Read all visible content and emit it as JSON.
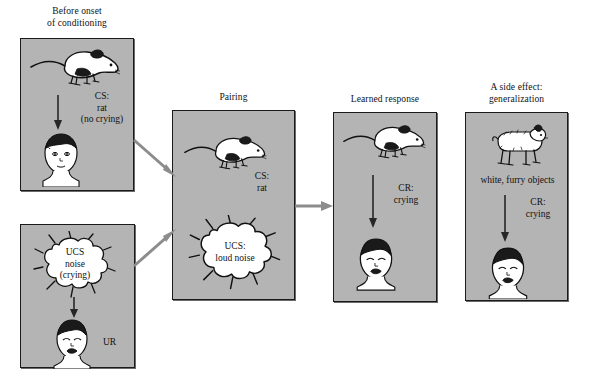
{
  "figure": {
    "background_color": "#ffffff",
    "panel_fill": "#b4b4b4",
    "panel_border": "#1a1a1a",
    "arrow_color_between_panels": "#8c8c8c",
    "arrow_color_inside_panel": "#262626"
  },
  "panels": [
    {
      "id": "before-onset",
      "caption": "Before onset\nof conditioning",
      "stimulus_icon": "rat-icon",
      "label": "CS:\nrat\n(no crying)",
      "response_icon": "baby-calm-icon",
      "response_label": ""
    },
    {
      "id": "ucs-noise",
      "caption": "",
      "stimulus_icon": "noise-burst-icon",
      "cloud_text": "UCS\nnoise\n(crying)",
      "label": "",
      "response_icon": "baby-crying-icon",
      "response_label": "UR"
    },
    {
      "id": "pairing",
      "caption": "Pairing",
      "stimulus_icon": "rat-icon",
      "label": "CS:\nrat",
      "cloud_text": "UCS:\nloud noise",
      "response_icon": "noise-burst-icon",
      "response_label": ""
    },
    {
      "id": "learned-response",
      "caption": "Learned response",
      "stimulus_icon": "rat-icon",
      "label": "CR:\ncrying",
      "response_icon": "baby-crying-icon",
      "response_label": ""
    },
    {
      "id": "generalization",
      "caption": "A side effect:\ngeneralization",
      "stimulus_icon": "furry-dog-toy-icon",
      "stimulus_label": "white, furry objects",
      "label": "CR:\ncrying",
      "response_icon": "baby-crying-icon",
      "response_label": ""
    }
  ],
  "connectors": [
    {
      "id": "before-to-pairing",
      "from": "before-onset",
      "to": "pairing",
      "icon": "arrow-diagonal-down-icon"
    },
    {
      "id": "ucs-to-pairing",
      "from": "ucs-noise",
      "to": "pairing",
      "icon": "arrow-diagonal-up-icon"
    },
    {
      "id": "pairing-to-learned",
      "from": "pairing",
      "to": "learned-response",
      "icon": "arrow-right-icon"
    }
  ]
}
